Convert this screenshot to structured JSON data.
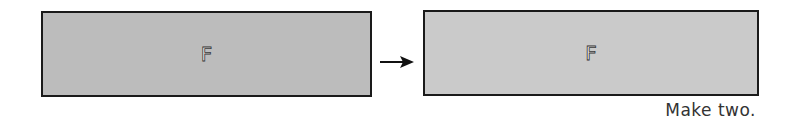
{
  "diagram": {
    "left_box": {
      "label": "F",
      "fill": "#bcbcbc"
    },
    "arrow": {
      "direction": "right",
      "icon": "arrow-right-icon"
    },
    "right_box": {
      "label": "F",
      "fill": "#cacaca"
    },
    "caption": "Make two."
  }
}
